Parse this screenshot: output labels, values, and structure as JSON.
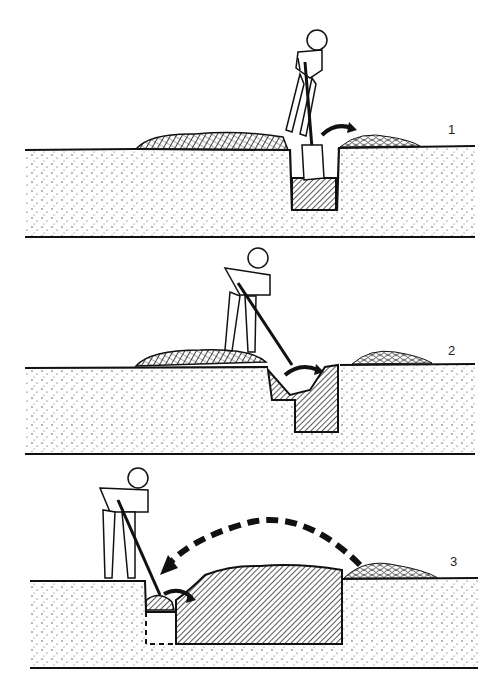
{
  "figure": {
    "steps": [
      {
        "label": "1",
        "description": "Dig first trench, soil thrown to the right pile"
      },
      {
        "label": "2",
        "description": "Loosen subsoil in trench and dig next row"
      },
      {
        "label": "3",
        "description": "Return soil from pile to last trench"
      }
    ]
  },
  "colors": {
    "ink": "#111111",
    "background": "#ffffff"
  }
}
